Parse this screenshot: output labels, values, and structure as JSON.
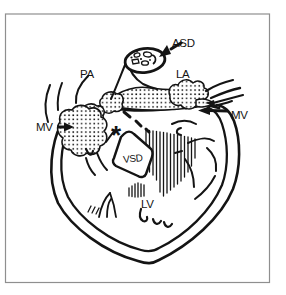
{
  "figure": {
    "colors": {
      "ink": "#141414",
      "background": "#ffffff",
      "frame": "#8f8f8f"
    },
    "labels": {
      "asd": "ASD",
      "pa": "PA",
      "la": "LA",
      "mv_left": "MV",
      "mv_right": "MV",
      "vsd": "VSD",
      "lv": "LV",
      "asterisk": "*"
    }
  }
}
